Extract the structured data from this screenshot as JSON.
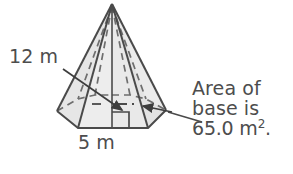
{
  "figure": {
    "kind": "geometry-diagram",
    "shape": "regular-polygonal-pyramid",
    "colors": {
      "face_fill": "#e9e9e9",
      "face_fill_shadow": "#e0e0e0",
      "stroke": "#4a4a4a",
      "hidden_stroke": "#6b6b6b",
      "text": "#4d4d4d",
      "background": "#ffffff"
    }
  },
  "labels": {
    "slant_height": "12 m",
    "base_edge": "5 m"
  },
  "callout": {
    "line1": "Area of",
    "line2": "base is",
    "line3_value": "65.0 m",
    "line3_exponent": "2",
    "line3_suffix": "."
  },
  "markers": {
    "right_angle": "right-angle-square",
    "slant_arrow": "arrow-to-slant-height",
    "base_arrow": "arrow-to-base",
    "leader": "leader-line-to-base"
  }
}
